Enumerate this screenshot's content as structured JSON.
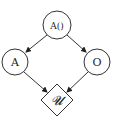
{
  "diagram": {
    "nodes": [
      {
        "id": "top",
        "label": "A()",
        "shape": "circle"
      },
      {
        "id": "left",
        "label": "A",
        "shape": "circle"
      },
      {
        "id": "right",
        "label": "O",
        "shape": "circle"
      },
      {
        "id": "utility",
        "label": "𝓤",
        "shape": "diamond"
      }
    ],
    "edges": [
      {
        "from": "top",
        "to": "left"
      },
      {
        "from": "top",
        "to": "right"
      },
      {
        "from": "left",
        "to": "utility"
      },
      {
        "from": "right",
        "to": "utility"
      }
    ],
    "colors": {
      "stroke": "#333333",
      "background": "#ffffff"
    }
  }
}
